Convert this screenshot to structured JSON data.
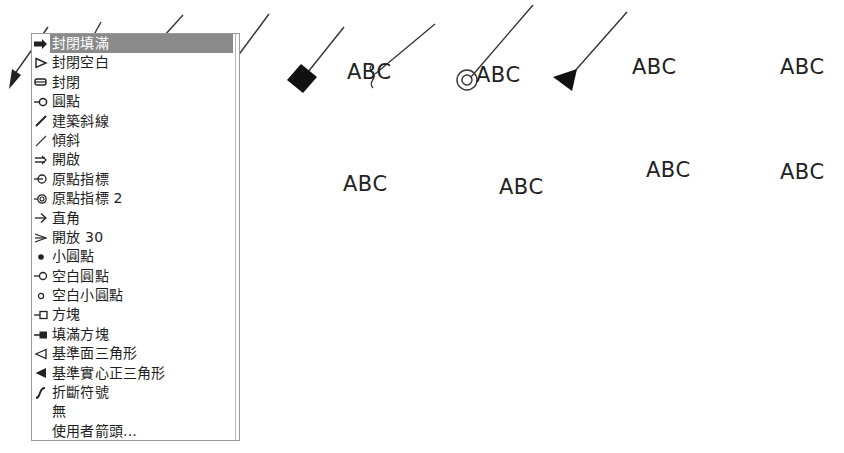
{
  "arrow_list": {
    "selected_index": 0,
    "items": [
      {
        "icon": "filled-closed-arrow-icon",
        "label": "封閉填滿"
      },
      {
        "icon": "open-closed-arrow-icon",
        "label": "封閉空白"
      },
      {
        "icon": "closed-arrow-icon",
        "label": "封閉"
      },
      {
        "icon": "dot-arrow-icon",
        "label": "圓點"
      },
      {
        "icon": "architectural-tick-icon",
        "label": "建築斜線"
      },
      {
        "icon": "oblique-icon",
        "label": "傾斜"
      },
      {
        "icon": "open-arrow-icon",
        "label": "開啟"
      },
      {
        "icon": "origin-indicator-icon",
        "label": "原點指標"
      },
      {
        "icon": "origin-indicator-2-icon",
        "label": "原點指標 2"
      },
      {
        "icon": "right-angle-arrow-icon",
        "label": "直角"
      },
      {
        "icon": "open-30-arrow-icon",
        "label": "開放 30"
      },
      {
        "icon": "small-dot-icon",
        "label": "小圓點"
      },
      {
        "icon": "blank-dot-icon",
        "label": "空白圓點"
      },
      {
        "icon": "small-blank-dot-icon",
        "label": "空白小圓點"
      },
      {
        "icon": "box-icon",
        "label": "方塊"
      },
      {
        "icon": "filled-box-icon",
        "label": "填滿方塊"
      },
      {
        "icon": "datum-triangle-icon",
        "label": "基準面三角形"
      },
      {
        "icon": "filled-datum-triangle-icon",
        "label": "基準實心正三角形"
      },
      {
        "icon": "integral-icon",
        "label": "折斷符號"
      },
      {
        "icon": "none-icon",
        "label": "無"
      },
      {
        "icon": "user-arrow-icon",
        "label": "使用者箭頭..."
      }
    ]
  },
  "preview": {
    "samples": [
      {
        "name": "closed-filled-arrow-sample",
        "text": "ABC"
      },
      {
        "name": "dot-sample",
        "text": "ABC"
      },
      {
        "name": "architectural-tick-sample",
        "text": "ABC"
      },
      {
        "name": "blank-dot-sample",
        "text": "ABC"
      },
      {
        "name": "filled-box-sample",
        "text": "ABC"
      },
      {
        "name": "integral-sample",
        "text": "ABC"
      },
      {
        "name": "origin-indicator-2-sample",
        "text": "ABC"
      },
      {
        "name": "filled-datum-triangle-sample",
        "text": "ABC"
      }
    ]
  },
  "colors": {
    "selection_bg": "#8a8a8a",
    "selection_text": "#ffffff",
    "text": "#1e1e1e",
    "border": "#9a9a9a"
  }
}
